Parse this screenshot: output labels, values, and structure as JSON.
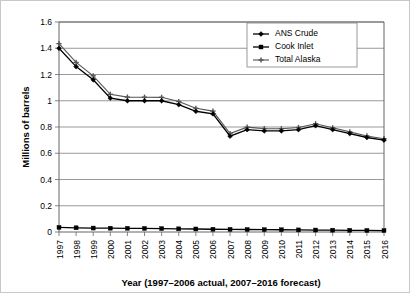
{
  "chart_data": {
    "type": "line",
    "title": "",
    "xlabel": "Year (1997–2006 actual, 2007–2016 forecast)",
    "ylabel": "Millions of barrels",
    "x": [
      1997,
      1998,
      1999,
      2000,
      2001,
      2002,
      2003,
      2004,
      2005,
      2006,
      2007,
      2008,
      2009,
      2010,
      2011,
      2012,
      2013,
      2014,
      2015,
      2016
    ],
    "categories": [
      "1997",
      "1998",
      "1999",
      "2000",
      "2001",
      "2002",
      "2003",
      "2004",
      "2005",
      "2006",
      "2007",
      "2008",
      "2009",
      "2010",
      "2011",
      "2012",
      "2013",
      "2014",
      "2015",
      "2016"
    ],
    "xlim": [
      1997,
      2016
    ],
    "ylim": [
      0,
      1.6
    ],
    "yticks": [
      0,
      0.2,
      0.4,
      0.6,
      0.8,
      1,
      1.2,
      1.4,
      1.6
    ],
    "ytick_labels": [
      "0",
      "0.2",
      "0.4",
      "0.6",
      "0.8",
      "1",
      "1.2",
      "1.4",
      "1.6"
    ],
    "grid": true,
    "legend_position": "top-right",
    "series": [
      {
        "name": "ANS Crude",
        "marker": "diamond",
        "color": "#000000",
        "values": [
          1.4,
          1.26,
          1.16,
          1.02,
          1.0,
          1.0,
          1.0,
          0.97,
          0.92,
          0.9,
          0.73,
          0.78,
          0.77,
          0.77,
          0.78,
          0.81,
          0.78,
          0.75,
          0.72,
          0.7
        ]
      },
      {
        "name": "Cook Inlet",
        "marker": "square",
        "color": "#000000",
        "values": [
          0.035,
          0.032,
          0.03,
          0.029,
          0.028,
          0.027,
          0.026,
          0.024,
          0.023,
          0.021,
          0.02,
          0.019,
          0.018,
          0.017,
          0.016,
          0.015,
          0.014,
          0.013,
          0.012,
          0.011
        ]
      },
      {
        "name": "Total Alaska",
        "marker": "cross",
        "color": "#555555",
        "values": [
          1.435,
          1.292,
          1.19,
          1.049,
          1.028,
          1.027,
          1.026,
          0.994,
          0.943,
          0.921,
          0.75,
          0.799,
          0.788,
          0.787,
          0.796,
          0.825,
          0.794,
          0.763,
          0.732,
          0.711
        ]
      }
    ]
  },
  "legend": {
    "items": [
      {
        "label": "ANS Crude"
      },
      {
        "label": "Cook Inlet"
      },
      {
        "label": "Total Alaska"
      }
    ]
  }
}
